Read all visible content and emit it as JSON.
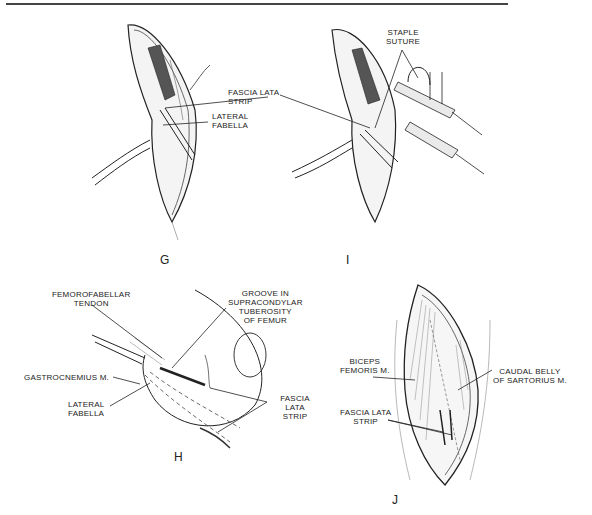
{
  "figure": {
    "panels": [
      {
        "id": "G",
        "letter": "G",
        "labels": [
          "FASCIA LATA STRIP",
          "LATERAL\nFABELLA"
        ]
      },
      {
        "id": "I",
        "letter": "I",
        "labels": [
          "STAPLE\nSUTURE"
        ]
      },
      {
        "id": "H",
        "letter": "H",
        "labels": [
          "FEMOROFABELLAR\nTENDON",
          "GROOVE IN\nSUPRACONDYLAR\nTUBEROSITY\nOF FEMUR",
          "GASTROCNEMIUS M.",
          "LATERAL\nFABELLA",
          "FASCIA LATA\nSTRIP"
        ]
      },
      {
        "id": "J",
        "letter": "J",
        "labels": [
          "BICEPS\nFEMORIS M.",
          "CAUDAL BELLY\nOF SARTORIUS M.",
          "FASCIA LATA\nSTRIP"
        ]
      }
    ]
  }
}
